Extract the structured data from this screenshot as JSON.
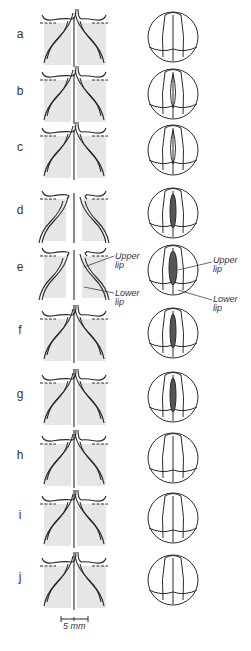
{
  "figure": {
    "rows": [
      {
        "label": "a",
        "stage": "open",
        "lips": "none"
      },
      {
        "label": "b",
        "stage": "closing",
        "lips": "none"
      },
      {
        "label": "c",
        "stage": "closing",
        "lips": "none"
      },
      {
        "label": "d",
        "stage": "lips-forming",
        "lips": "dark"
      },
      {
        "label": "e",
        "stage": "lips-formed",
        "lips": "dark"
      },
      {
        "label": "f",
        "stage": "closing-lips",
        "lips": "dark"
      },
      {
        "label": "g",
        "stage": "closing-lips",
        "lips": "dark"
      },
      {
        "label": "h",
        "stage": "closed",
        "lips": "none"
      },
      {
        "label": "i",
        "stage": "closed",
        "lips": "none"
      },
      {
        "label": "j",
        "stage": "closed",
        "lips": "none"
      }
    ],
    "annotations": {
      "upper_lip_left": "Upper lip",
      "lower_lip_left": "Lower lip",
      "upper_lip_right": "Upper lip",
      "lower_lip_right": "Lower lip"
    },
    "scale_bar": {
      "label": "5 mm"
    },
    "colors": {
      "stroke": "#2a2a2a",
      "shade": "#e6e6e6",
      "label": "#333333"
    }
  }
}
